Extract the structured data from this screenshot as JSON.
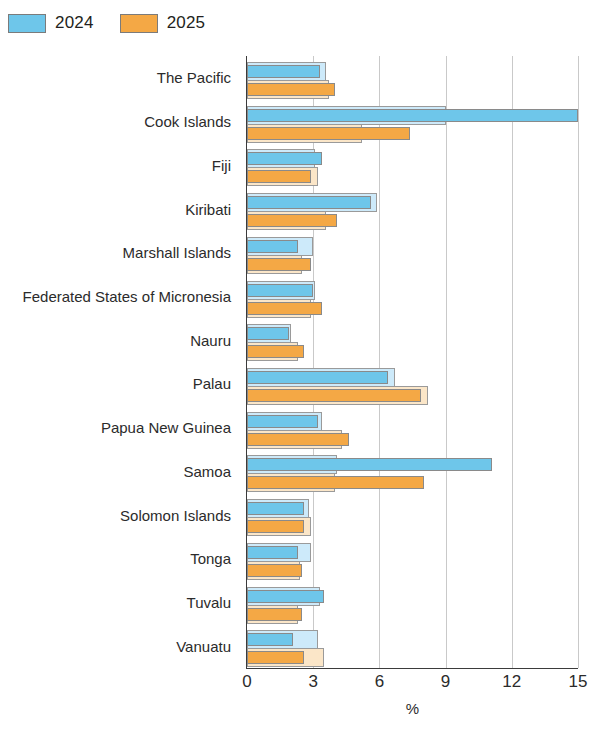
{
  "legend": {
    "position": "top-left",
    "items": [
      {
        "label": "2024",
        "color": "#6ec6ea",
        "name": "legend-2024"
      },
      {
        "label": "2025",
        "color": "#f4a845",
        "name": "legend-2025"
      }
    ]
  },
  "colors": {
    "series_2024": "#6ec6ea",
    "series_2025": "#f4a845",
    "series_2024_light": "#cdeafa",
    "series_2025_light": "#fbe6c8",
    "gridline": "#c9c9c9",
    "axis": "#3b3b3b",
    "text": "#231f20"
  },
  "chart_data": {
    "type": "bar",
    "orientation": "horizontal",
    "title": "",
    "subtitle": "",
    "xlabel": "%",
    "ylabel": "",
    "xlim": [
      0,
      15
    ],
    "xticks": [
      0,
      3,
      6,
      9,
      12,
      15
    ],
    "xtick_labels": [
      "0",
      "3",
      "6",
      "9",
      "12",
      "15"
    ],
    "grid": "vertical",
    "legend_position": "top-left",
    "categories": [
      "The Pacific",
      "Cook Islands",
      "Fiji",
      "Kiribati",
      "Marshall Islands",
      "Federated States of Micronesia",
      "Nauru",
      "Palau",
      "Papua New Guinea",
      "Samoa",
      "Solomon Islands",
      "Tonga",
      "Tuvalu",
      "Vanuatu"
    ],
    "series": [
      {
        "name": "2024",
        "color": "#6ec6ea",
        "values": [
          3.3,
          15.0,
          3.4,
          5.6,
          2.3,
          3.0,
          1.9,
          6.4,
          3.2,
          11.1,
          2.6,
          2.3,
          3.5,
          2.1
        ]
      },
      {
        "name": "2025",
        "color": "#f4a845",
        "values": [
          4.0,
          7.4,
          2.9,
          4.1,
          2.9,
          3.4,
          2.6,
          7.9,
          4.6,
          8.0,
          2.6,
          2.5,
          2.5,
          2.6
        ]
      }
    ],
    "outline_series": [
      {
        "name": "2024-outline",
        "color": "#cdeafa",
        "values": [
          3.6,
          9.0,
          3.1,
          5.9,
          3.0,
          3.1,
          2.0,
          6.7,
          3.4,
          4.1,
          2.8,
          2.9,
          3.3,
          3.2
        ]
      },
      {
        "name": "2025-outline",
        "color": "#fbe6c8",
        "values": [
          3.7,
          5.2,
          3.2,
          3.6,
          2.5,
          2.9,
          2.3,
          8.2,
          4.3,
          4.0,
          2.9,
          2.4,
          2.3,
          3.5
        ]
      }
    ]
  }
}
